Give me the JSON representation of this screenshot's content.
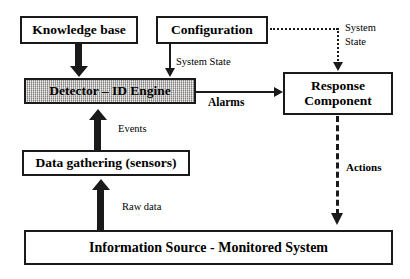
{
  "diagram": {
    "background_color": "#ffffff",
    "line_color": "#1a1a1a",
    "highlight_fill_color": "#b7b5b2",
    "nodes": [
      {
        "id": "knowledge-base",
        "label": "Knowledge base"
      },
      {
        "id": "configuration",
        "label": "Configuration"
      },
      {
        "id": "detector",
        "label": "Detector – ID Engine",
        "shaded": true
      },
      {
        "id": "response",
        "label_line1": "Response",
        "label_line2": "Component"
      },
      {
        "id": "data-gathering",
        "label": "Data gathering (sensors)"
      },
      {
        "id": "info-source",
        "label": "Information Source - Monitored System"
      }
    ],
    "edges": [
      {
        "id": "kb-to-detector",
        "label": "",
        "from": "knowledge-base",
        "to": "detector",
        "style": "thick-solid",
        "direction": "down"
      },
      {
        "id": "config-to-detector",
        "label": "System State",
        "from": "configuration",
        "to": "detector",
        "style": "thin-solid",
        "direction": "down"
      },
      {
        "id": "config-to-response",
        "label_line1": "System",
        "label_line2": "State",
        "from": "configuration",
        "to": "response",
        "style": "dotted",
        "direction": "down"
      },
      {
        "id": "detector-to-response",
        "label": "Alarms",
        "from": "detector",
        "to": "response",
        "style": "thin-solid",
        "direction": "right"
      },
      {
        "id": "sensors-to-detector",
        "label": "Events",
        "from": "data-gathering",
        "to": "detector",
        "style": "thick-solid",
        "direction": "up"
      },
      {
        "id": "source-to-sensors",
        "label": "Raw data",
        "from": "info-source",
        "to": "data-gathering",
        "style": "thick-solid",
        "direction": "up"
      },
      {
        "id": "response-to-source",
        "label": "Actions",
        "from": "response",
        "to": "info-source",
        "style": "dashed",
        "direction": "down"
      }
    ]
  }
}
